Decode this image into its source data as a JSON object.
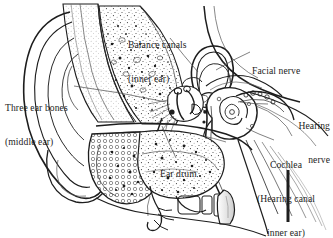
{
  "figure": {
    "background_color": "#ffffff",
    "ink_color": "#1d1d1d",
    "width": 333,
    "height": 238
  },
  "labels": {
    "balance_canals": {
      "line1": "Balance canals",
      "line2": "(inner ear)"
    },
    "facial_nerve": {
      "line1": "Facial nerve"
    },
    "three_ear_bones": {
      "line1": "Three ear bones",
      "line2": "(middle ear)"
    },
    "hearing_nerve": {
      "line1": "Hearing",
      "line2": "nerve"
    },
    "cochlea": {
      "line1": "Cochlea",
      "line2": "(Hearing canal",
      "line3": "inner ear)"
    },
    "ear_drum": {
      "line1": "Ear drum"
    }
  },
  "anatomy_parts": [
    "pinna-outer-ear",
    "ear-canal",
    "ear-drum",
    "three-ear-bones-ossicles",
    "balance-canals-semicircular",
    "cochlea",
    "hearing-nerve",
    "facial-nerve",
    "eustachian-tube",
    "mastoid-bone",
    "ear-lobe"
  ]
}
